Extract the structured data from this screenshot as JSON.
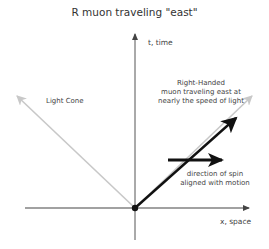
{
  "title": "R muon traveling \"east\"",
  "axes": {
    "y_label": "t, time",
    "x_label": "x, space"
  },
  "labels": {
    "light_cone": "Light Cone",
    "muon_line1": "Right-Handed",
    "muon_line2": "muon traveling east at",
    "muon_line3": "nearly the  speed of light",
    "spin_line1": "direction of spin",
    "spin_line2": "aligned with motion"
  },
  "colors": {
    "axis": "#444444",
    "light_cone": "#c8c8c8",
    "muon": "#111111",
    "spin": "#111111"
  }
}
